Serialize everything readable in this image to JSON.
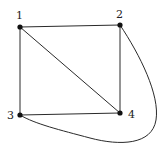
{
  "diagram": {
    "type": "graph",
    "nodes": [
      {
        "id": "1",
        "label": "1",
        "x": 20,
        "y": 27,
        "label_x": 16,
        "label_y": 19
      },
      {
        "id": "2",
        "label": "2",
        "x": 120,
        "y": 25,
        "label_x": 116,
        "label_y": 18
      },
      {
        "id": "3",
        "label": "3",
        "x": 20,
        "y": 115,
        "label_x": 7,
        "label_y": 119
      },
      {
        "id": "4",
        "label": "4",
        "x": 120,
        "y": 113,
        "label_x": 128,
        "label_y": 118
      }
    ],
    "edges": [
      {
        "from": "1",
        "to": "2",
        "shape": "straight"
      },
      {
        "from": "1",
        "to": "3",
        "shape": "straight"
      },
      {
        "from": "1",
        "to": "4",
        "shape": "straight"
      },
      {
        "from": "2",
        "to": "4",
        "shape": "straight"
      },
      {
        "from": "3",
        "to": "4",
        "shape": "straight"
      },
      {
        "from": "2",
        "to": "3",
        "shape": "curved"
      }
    ],
    "colors": {
      "edge": "#2a2a2a",
      "node": "#111111",
      "label": "#222222",
      "background": "#ffffff"
    }
  }
}
